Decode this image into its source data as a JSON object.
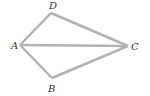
{
  "diagram": {
    "type": "geometry-quadrilateral",
    "stroke_color": "#b3b3b3",
    "label_color": "#333333",
    "points": {
      "A": {
        "x": 20,
        "y": 45,
        "label": "A",
        "lx": 11,
        "ly": 49
      },
      "B": {
        "x": 52,
        "y": 78,
        "label": "B",
        "lx": 48,
        "ly": 92
      },
      "C": {
        "x": 128,
        "y": 46,
        "label": "C",
        "lx": 131,
        "ly": 50
      },
      "D": {
        "x": 51,
        "y": 13,
        "label": "D",
        "lx": 49,
        "ly": 9
      }
    },
    "segments": [
      [
        "A",
        "D"
      ],
      [
        "D",
        "C"
      ],
      [
        "C",
        "B"
      ],
      [
        "B",
        "A"
      ],
      [
        "A",
        "C"
      ]
    ]
  }
}
